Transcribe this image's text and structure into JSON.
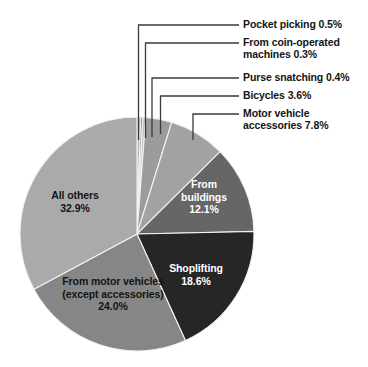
{
  "chart_data": {
    "type": "pie",
    "title": "",
    "subtitle": "",
    "xlabel": "",
    "ylabel": "",
    "legend_position": "callout-labels",
    "grid": false,
    "units": "percent",
    "categories": [
      "Pocket picking",
      "From coin-operated machines",
      "Purse snatching",
      "Bicycles",
      "Motor vehicle accessories",
      "From buildings",
      "Shoplifting",
      "From motor vehicles (except accessories)",
      "All others"
    ],
    "values": [
      0.5,
      0.3,
      0.4,
      3.6,
      7.8,
      12.1,
      18.6,
      24.0,
      32.9
    ],
    "colors": [
      "#b4b4b4",
      "#8e8e8e",
      "#c2c2c2",
      "#9b9b9b",
      "#a2a2a2",
      "#666666",
      "#262626",
      "#868686",
      "#aaaaaa"
    ],
    "start_angle_deg": 0,
    "direction": "clockwise",
    "slices": [
      {
        "name": "pocket-picking",
        "label": "Pocket picking 0.5%",
        "value": 0.5,
        "color": "#b4b4b4",
        "label_style": "callout"
      },
      {
        "name": "coin-operated",
        "label": "From coin-operated\nmachines 0.3%",
        "value": 0.3,
        "color": "#8e8e8e",
        "label_style": "callout"
      },
      {
        "name": "purse-snatching",
        "label": "Purse snatching 0.4%",
        "value": 0.4,
        "color": "#c2c2c2",
        "label_style": "callout"
      },
      {
        "name": "bicycles",
        "label": "Bicycles 3.6%",
        "value": 3.6,
        "color": "#9b9b9b",
        "label_style": "callout"
      },
      {
        "name": "motor-vehicle-access",
        "label": "Motor vehicle\naccessories 7.8%",
        "value": 7.8,
        "color": "#a2a2a2",
        "label_style": "callout"
      },
      {
        "name": "from-buildings",
        "label": "From\nbuildings\n12.1%",
        "value": 12.1,
        "color": "#666666",
        "label_style": "inside-dark"
      },
      {
        "name": "shoplifting",
        "label": "Shoplifting\n18.6%",
        "value": 18.6,
        "color": "#262626",
        "label_style": "inside-dark"
      },
      {
        "name": "from-motor-vehicles",
        "label": "From motor vehicles\n(except accessories)\n24.0%",
        "value": 24.0,
        "color": "#868686",
        "label_style": "inside-light"
      },
      {
        "name": "all-others",
        "label": "All others\n32.9%",
        "value": 32.9,
        "color": "#aaaaaa",
        "label_style": "inside-light"
      }
    ]
  },
  "callouts": {
    "pocket_picking": "Pocket picking 0.5%",
    "coin_operated": "From coin-operated\nmachines 0.3%",
    "purse_snatching": "Purse snatching 0.4%",
    "bicycles": "Bicycles 3.6%",
    "motor_vehicle_accessories": "Motor vehicle\naccessories 7.8%"
  },
  "inside_labels": {
    "all_others": "All others\n32.9%",
    "from_motor_vehicles": "From motor vehicles\n(except accessories)\n24.0%",
    "shoplifting": "Shoplifting\n18.6%",
    "from_buildings": "From\nbuildings\n12.1%"
  },
  "geometry": {
    "center_x": 137,
    "center_y": 234,
    "radius": 117
  },
  "style": {
    "background": "#ffffff",
    "leader_line_color": "#3a3a3a",
    "slice_separator": "#f2f2f2",
    "text_color": "#141414",
    "text_on_dark": "#ffffff"
  }
}
